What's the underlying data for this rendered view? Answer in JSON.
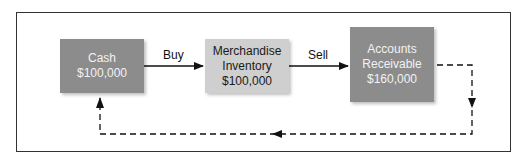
{
  "diagram": {
    "nodes": [
      {
        "id": "cash",
        "lines": [
          "Cash",
          "$100,000"
        ],
        "fill": "#8c8c8c"
      },
      {
        "id": "merchandise_inventory",
        "lines": [
          "Merchandise",
          "Inventory",
          "$100,000"
        ],
        "fill": "#cfcfcf"
      },
      {
        "id": "accounts_receivable",
        "lines": [
          "Accounts",
          "Receivable",
          "$160,000"
        ],
        "fill": "#8c8c8c"
      }
    ],
    "edges": [
      {
        "from": "cash",
        "to": "merchandise_inventory",
        "label": "Buy",
        "style": "solid"
      },
      {
        "from": "merchandise_inventory",
        "to": "accounts_receivable",
        "label": "Sell",
        "style": "solid"
      },
      {
        "from": "accounts_receivable",
        "to": "cash",
        "label": "",
        "style": "dashed"
      }
    ]
  }
}
